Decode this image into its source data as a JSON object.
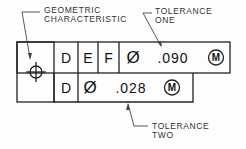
{
  "labels": {
    "geometric": [
      "GEOMETRIC",
      "CHARACTERISTIC"
    ],
    "tolerance_one": [
      "TOLERANCE",
      "ONE"
    ],
    "tolerance_two": [
      "TOLERANCE",
      "TWO"
    ]
  },
  "frame": {
    "symbol": "position-icon",
    "row1": {
      "datums": [
        "D",
        "E",
        "F"
      ],
      "diameter": "Ø",
      "value": ".090",
      "modifier": "M"
    },
    "row2": {
      "datums": [
        "D"
      ],
      "diameter": "Ø",
      "value": ".028",
      "modifier": "M"
    }
  }
}
